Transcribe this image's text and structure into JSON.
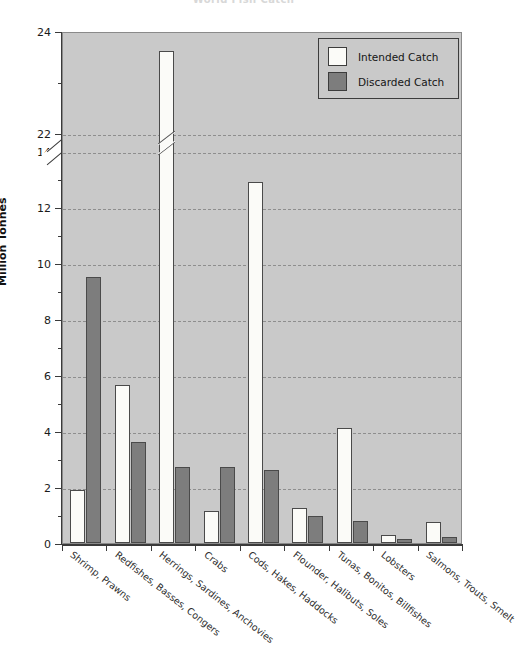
{
  "chart_data": {
    "type": "bar",
    "title": "World Fish Catch",
    "xlabel": "",
    "ylabel": "Million Tonnes",
    "ylim": [
      0,
      24
    ],
    "axis_break": {
      "present": true,
      "from": 14,
      "to": 22
    },
    "grid": "horizontal-dashed",
    "legend_position": "top-right",
    "categories": [
      "Shrimp, Prawns",
      "Redfishes, Basses, Congers",
      "Herrings, Sardines, Anchovies",
      "Crabs",
      "Cods, Hakes, Haddocks",
      "Flounder, Halibuts, Soles",
      "Tunas, Bonitos, Billfishes",
      "Lobsters",
      "Salmons, Trouts, Smelt"
    ],
    "series": [
      {
        "name": "Intended Catch",
        "color": "#fbfbf8",
        "values": [
          1.9,
          5.65,
          23.6,
          1.15,
          12.9,
          1.25,
          4.1,
          0.3,
          0.75
        ]
      },
      {
        "name": "Discarded Catch",
        "color": "#7d7d7d",
        "values": [
          9.5,
          3.6,
          2.7,
          2.7,
          2.6,
          0.95,
          0.8,
          0.15,
          0.2
        ]
      }
    ],
    "y_ticks_major": [
      0,
      2,
      4,
      6,
      8,
      10,
      12,
      14,
      22,
      24
    ],
    "y_tick_labels": [
      "0",
      "2",
      "4",
      "6",
      "8",
      "10",
      "12",
      "14",
      "22",
      "24"
    ]
  },
  "legend": {
    "items": [
      {
        "label": "Intended Catch",
        "swatch": "intended"
      },
      {
        "label": "Discarded Catch",
        "swatch": "discarded"
      }
    ]
  },
  "colors": {
    "plot_background": "#c9c9c9",
    "page_background": "#ffffff",
    "axis": "#3a3a3a",
    "gridline": "#8e8e8e",
    "intended": "#fbfbf8",
    "discarded": "#7d7d7d"
  }
}
